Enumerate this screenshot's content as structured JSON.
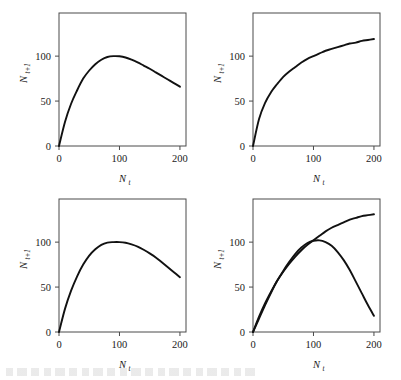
{
  "figure": {
    "background": "#ffffff",
    "curve_color": "#111111",
    "axis_color": "#4a4a4a",
    "panel_count": 4
  },
  "axes": {
    "x_label": "N",
    "x_label_sub": "t",
    "y_label": "N",
    "y_label_sub": "t+1",
    "x_ticks": [
      "0",
      "100",
      "200"
    ],
    "y_ticks": [
      "0",
      "50",
      "100"
    ],
    "x_tick_values": [
      0,
      100,
      200
    ],
    "y_tick_values": [
      0,
      50,
      100
    ],
    "xlim": [
      0,
      210
    ],
    "ylim": [
      0,
      148
    ]
  },
  "chart_data": [
    {
      "id": "panel-top-left",
      "type": "line",
      "title": "",
      "xlabel": "N_t",
      "ylabel": "N_t+1",
      "xlim": [
        0,
        210
      ],
      "ylim": [
        0,
        148
      ],
      "grid": false,
      "legend": "none",
      "series": [
        {
          "name": "ricker-skewed",
          "x": [
            0,
            10,
            20,
            30,
            40,
            50,
            60,
            70,
            80,
            90,
            100,
            110,
            120,
            130,
            140,
            150,
            160,
            170,
            180,
            190,
            200
          ],
          "y": [
            0,
            27,
            47,
            62,
            75,
            84,
            91,
            96,
            99,
            100,
            99.8,
            98.5,
            96,
            93,
            89.5,
            86,
            82,
            78,
            74,
            70,
            66
          ]
        }
      ],
      "annotation": "hump-shaped curve peaking near N_t = 90 at N_t+1 = 100, declining to about 66 at N_t = 200"
    },
    {
      "id": "panel-top-right",
      "type": "line",
      "title": "",
      "xlabel": "N_t",
      "ylabel": "N_t+1",
      "xlim": [
        0,
        210
      ],
      "ylim": [
        0,
        148
      ],
      "grid": false,
      "legend": "none",
      "series": [
        {
          "name": "saturating",
          "x": [
            0,
            10,
            20,
            30,
            40,
            50,
            60,
            70,
            80,
            90,
            100,
            110,
            120,
            130,
            140,
            150,
            160,
            170,
            180,
            190,
            200
          ],
          "y": [
            0,
            30,
            48,
            60,
            69,
            77,
            83,
            88,
            93,
            97,
            100,
            103,
            106,
            108,
            110,
            112,
            114,
            115,
            117,
            118,
            119
          ]
        }
      ],
      "annotation": "monotonic saturating curve rising to about 119 at N_t = 200"
    },
    {
      "id": "panel-bottom-left",
      "type": "line",
      "title": "",
      "xlabel": "N_t",
      "ylabel": "N_t+1",
      "xlim": [
        0,
        210
      ],
      "ylim": [
        0,
        148
      ],
      "grid": false,
      "legend": "none",
      "series": [
        {
          "name": "symmetric-hump",
          "x": [
            0,
            10,
            20,
            30,
            40,
            50,
            60,
            70,
            80,
            90,
            100,
            110,
            120,
            130,
            140,
            150,
            160,
            170,
            180,
            190,
            200
          ],
          "y": [
            0,
            26,
            46,
            62,
            75,
            85,
            92,
            97,
            99.5,
            100,
            100,
            99.3,
            97.5,
            95,
            91.5,
            87.5,
            83,
            77.5,
            72,
            66.5,
            61
          ]
        }
      ],
      "annotation": "broad symmetric hump peaking near N_t = 100 at N_t+1 = 100, falling to about 61 at N_t = 200"
    },
    {
      "id": "panel-bottom-right",
      "type": "line",
      "title": "",
      "xlabel": "N_t",
      "ylabel": "N_t+1",
      "xlim": [
        0,
        210
      ],
      "ylim": [
        0,
        148
      ],
      "grid": false,
      "legend": "none",
      "series": [
        {
          "name": "saturating",
          "x": [
            0,
            10,
            20,
            30,
            40,
            50,
            60,
            70,
            80,
            90,
            100,
            110,
            120,
            130,
            140,
            150,
            160,
            170,
            180,
            190,
            200
          ],
          "y": [
            0,
            17,
            32,
            45,
            57,
            67,
            76,
            84,
            91,
            97,
            102,
            107,
            112,
            116,
            119,
            122,
            125,
            127,
            129,
            130,
            131
          ]
        },
        {
          "name": "hump",
          "x": [
            0,
            10,
            20,
            30,
            40,
            50,
            60,
            70,
            80,
            90,
            100,
            110,
            120,
            130,
            140,
            150,
            160,
            170,
            180,
            190,
            200
          ],
          "y": [
            0,
            15,
            30,
            44,
            57,
            68,
            78,
            87,
            94,
            99,
            101.5,
            102,
            100,
            96,
            89,
            80,
            69,
            56,
            43,
            30,
            18
          ]
        }
      ],
      "annotation": "two curves from the origin crossing near N_t = 105 at N_t+1 = 101; saturating branch reaches 131 while the hump branch falls to 18 at N_t = 200"
    }
  ]
}
